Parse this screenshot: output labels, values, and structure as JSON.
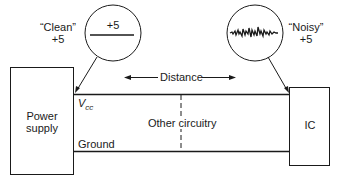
{
  "diagram": {
    "power_supply": {
      "label_line1": "Power",
      "label_line2": "supply"
    },
    "ic": {
      "label": "IC"
    },
    "clean_callout": {
      "quote": "“Clean”",
      "value": "+5",
      "inset_value": "+5"
    },
    "noisy_callout": {
      "quote": "“Noisy”",
      "value": "+5"
    },
    "distance_label": "Distance",
    "vcc_label": "V",
    "vcc_subscript": "cc",
    "ground_label": "Ground",
    "other_circuitry_label": "Other circuitry",
    "colors": {
      "line": "#1a1a1a",
      "background": "#ffffff"
    }
  }
}
